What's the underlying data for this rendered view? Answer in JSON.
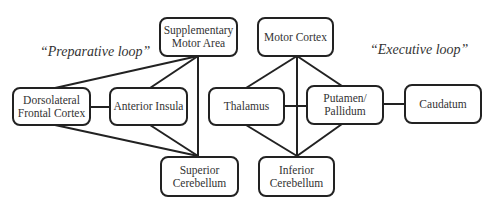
{
  "labels": {
    "preparative": "“Preparative loop”",
    "executive": "“Executive loop”"
  },
  "nodes": {
    "sma": {
      "line1": "Supplementary",
      "line2": "Motor Area"
    },
    "motor_cortex": {
      "line1": "Motor Cortex"
    },
    "dlpfc": {
      "line1": "Dorsolateral",
      "line2": "Frontal Cortex"
    },
    "insula": {
      "line1": "Anterior Insula"
    },
    "thalamus": {
      "line1": "Thalamus"
    },
    "putamen": {
      "line1": "Putamen/",
      "line2": "Pallidum"
    },
    "caudatum": {
      "line1": "Caudatum"
    },
    "sup_cerebellum": {
      "line1": "Superior",
      "line2": "Cerebellum"
    },
    "inf_cerebellum": {
      "line1": "Inferior",
      "line2": "Cerebellum"
    }
  },
  "edges": [
    [
      "Supplementary Motor Area",
      "Dorsolateral Frontal Cortex"
    ],
    [
      "Supplementary Motor Area",
      "Anterior Insula"
    ],
    [
      "Supplementary Motor Area",
      "Superior Cerebellum"
    ],
    [
      "Dorsolateral Frontal Cortex",
      "Anterior Insula"
    ],
    [
      "Dorsolateral Frontal Cortex",
      "Superior Cerebellum"
    ],
    [
      "Anterior Insula",
      "Superior Cerebellum"
    ],
    [
      "Motor Cortex",
      "Thalamus"
    ],
    [
      "Motor Cortex",
      "Putamen/Pallidum"
    ],
    [
      "Motor Cortex",
      "Inferior Cerebellum"
    ],
    [
      "Thalamus",
      "Putamen/Pallidum"
    ],
    [
      "Thalamus",
      "Inferior Cerebellum"
    ],
    [
      "Putamen/Pallidum",
      "Inferior Cerebellum"
    ],
    [
      "Putamen/Pallidum",
      "Caudatum"
    ]
  ]
}
